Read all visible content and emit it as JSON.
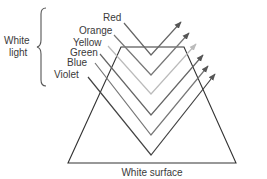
{
  "diagram": {
    "title_group": {
      "line1": "White",
      "line2": "light"
    },
    "surface_label": "White surface",
    "rays": [
      {
        "name": "Red",
        "color": "#666666",
        "start": [
          124,
          23
        ],
        "vertex": [
          151,
          55
        ],
        "tip": [
          181,
          22
        ]
      },
      {
        "name": "Orange",
        "color": "#777777",
        "start": [
          114,
          35
        ],
        "vertex": [
          151,
          75
        ],
        "tip": [
          189,
          33
        ]
      },
      {
        "name": "Yellow",
        "color": "#bbbbbb",
        "start": [
          108,
          46
        ],
        "vertex": [
          151,
          94
        ],
        "tip": [
          196,
          44
        ]
      },
      {
        "name": "Green",
        "color": "#666666",
        "start": [
          100,
          54
        ],
        "vertex": [
          151,
          115
        ],
        "tip": [
          203,
          55
        ]
      },
      {
        "name": "Blue",
        "color": "#777777",
        "start": [
          95,
          63
        ],
        "vertex": [
          151,
          135
        ],
        "tip": [
          208,
          66
        ]
      },
      {
        "name": "Violet",
        "color": "#444444",
        "start": [
          88,
          77
        ],
        "vertex": [
          151,
          155
        ],
        "tip": [
          215,
          74
        ]
      }
    ],
    "labels": {
      "red": "Red",
      "orange": "Orange",
      "yellow": "Yellow",
      "green": "Green",
      "blue": "Blue",
      "violet": "Violet"
    },
    "colors": {
      "outline": "#333333",
      "text": "#3a3a3a"
    }
  }
}
